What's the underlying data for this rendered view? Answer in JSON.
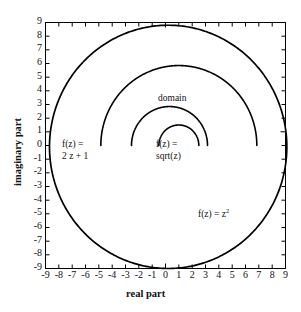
{
  "figure": {
    "background_color": "#ffffff",
    "line_color": "#000000"
  },
  "axes": {
    "xlabel": "real part",
    "ylabel": "imaginary part",
    "x_ticks": [
      "-9",
      "-8",
      "-7",
      "-6",
      "-5",
      "-4",
      "-3",
      "-2",
      "-1",
      "0",
      "1",
      "2",
      "3",
      "4",
      "5",
      "6",
      "7",
      "8",
      "9"
    ],
    "y_ticks": [
      "9",
      "8",
      "7",
      "6",
      "5",
      "4",
      "3",
      "2",
      "1",
      "0",
      "-1",
      "-2",
      "-3",
      "-4",
      "-5",
      "-6",
      "-7",
      "-8",
      "-9"
    ]
  },
  "annotations": {
    "domain": "domain",
    "two_z_plus_one_line1": "f(z) =",
    "two_z_plus_one_line2": "2 z + 1",
    "sqrt_line1": "f(z) =",
    "sqrt_line2": "sqrt(z)",
    "z_squared_prefix": "f(z) = z",
    "z_squared_exponent": "2"
  },
  "chart_data": {
    "type": "line",
    "title": "",
    "xlabel": "real part",
    "ylabel": "imaginary part",
    "xlim": [
      -9,
      9
    ],
    "ylim": [
      -9,
      9
    ],
    "grid": false,
    "legend": "annotations-inline",
    "series": [
      {
        "name": "domain",
        "label": "domain",
        "shape": "upper-semicircle-arc",
        "center": [
          1.0,
          0.0
        ],
        "radius": 1.5,
        "start_angle_deg": 0,
        "end_angle_deg": 180,
        "endpoints": [
          [
            2.5,
            0.0
          ],
          [
            -0.5,
            0.0
          ]
        ],
        "color": "#000000"
      },
      {
        "name": "f(z) = sqrt(z)",
        "label": "sqrt(z)",
        "shape": "upper-semicircle-arc",
        "center": [
          0.3,
          0.0
        ],
        "radius": 2.85,
        "start_angle_deg": 0,
        "end_angle_deg": 180,
        "endpoints": [
          [
            3.15,
            0.0
          ],
          [
            -2.55,
            0.0
          ]
        ],
        "color": "#000000"
      },
      {
        "name": "f(z) = 2 z + 1",
        "label": "2 z + 1",
        "shape": "upper-semicircle-arc",
        "center": [
          1.0,
          0.0
        ],
        "radius": 5.85,
        "start_angle_deg": 0,
        "end_angle_deg": 180,
        "endpoints": [
          [
            6.85,
            0.0
          ],
          [
            -4.85,
            0.0
          ]
        ],
        "color": "#000000"
      },
      {
        "name": "f(z) = z^2",
        "label": "z squared",
        "shape": "full-circle",
        "center": [
          0.2,
          -0.1
        ],
        "radius": 8.9,
        "start_angle_deg": 0,
        "end_angle_deg": 360,
        "endpoints": [
          [
            9.1,
            -0.1
          ],
          [
            -8.7,
            -0.1
          ]
        ],
        "color": "#000000"
      }
    ]
  }
}
